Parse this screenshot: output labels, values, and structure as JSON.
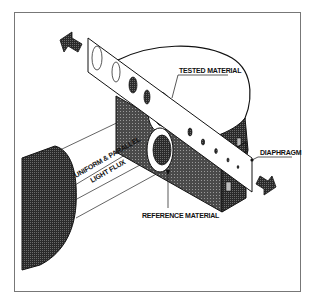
{
  "diagram": {
    "type": "technical-illustration",
    "labels": {
      "tested_material": "TESTED MATERIAL",
      "diaphragm": "DIAPHRAGM",
      "flux_line1": "UNIFORM & PARALLEL",
      "flux_line2": "LIGHT FLUX",
      "reference_material": "REFERENCE MATERIAL"
    },
    "colors": {
      "ink": "#111111",
      "hatch": "#3a3a3a",
      "paper": "#ffffff",
      "frame": "#777777"
    }
  }
}
